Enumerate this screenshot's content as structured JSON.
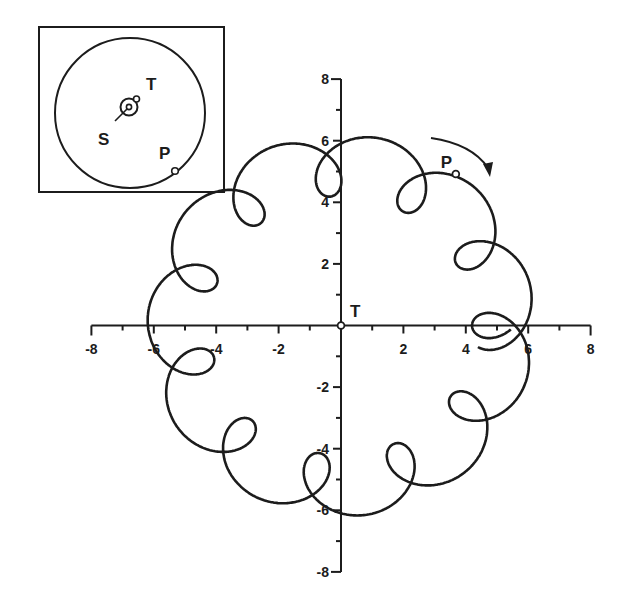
{
  "chart_data": {
    "type": "line",
    "title": "",
    "xlabel": "",
    "ylabel": "",
    "xlim": [
      -8,
      8
    ],
    "ylim": [
      -8,
      8
    ],
    "x_ticks": [
      -8,
      -6,
      -4,
      -2,
      2,
      4,
      6,
      8
    ],
    "y_ticks": [
      -8,
      -6,
      -4,
      -2,
      2,
      4,
      6,
      8
    ],
    "x_tick_labels": [
      "-8",
      "-6",
      "-4",
      "-2",
      "2",
      "4",
      "6",
      "8"
    ],
    "y_tick_labels": [
      "-8",
      "-6",
      "-4",
      "-2",
      "2",
      "4",
      "6",
      "8"
    ],
    "grid": false,
    "loop_count": 11,
    "approx_max_radius": 6.2,
    "approx_min_radius": 4.2,
    "loop_centers": [
      [
        4.8,
        0.0
      ],
      [
        4.0,
        2.7
      ],
      [
        2.1,
        4.3
      ],
      [
        -0.6,
        4.5
      ],
      [
        -3.1,
        3.6
      ],
      [
        -4.6,
        1.3
      ],
      [
        -4.6,
        -1.3
      ],
      [
        -3.0,
        -3.6
      ],
      [
        -0.6,
        -4.8
      ],
      [
        2.0,
        -4.3
      ],
      [
        4.0,
        -2.6
      ]
    ],
    "model": {
      "outer_orbit_radius": 5.2,
      "inner_orbit_radius": 1.0,
      "outer_period_years": 11.86,
      "inner_period_years": 1.0,
      "t_start": -0.3,
      "t_end": 11.9,
      "direction": "clockwise"
    },
    "markers": {
      "P": {
        "x": 3.68,
        "y": 4.92,
        "label": "P"
      },
      "T": {
        "x": 0,
        "y": 0,
        "label": "T"
      }
    },
    "annotation_arrow": "clockwise-arrow near P"
  },
  "inset": {
    "labels": {
      "T": "T",
      "S": "S",
      "P": "P"
    }
  },
  "colors": {
    "ink": "#1c1c1c",
    "background": "#ffffff"
  }
}
